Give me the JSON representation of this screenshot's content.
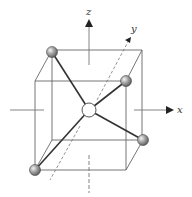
{
  "diagram": {
    "axes": {
      "x_label": "x",
      "y_label": "y",
      "z_label": "z"
    },
    "colors": {
      "line": "#555555",
      "bond": "#333333",
      "atom_fill": "#9a9a9a",
      "center_fill": "#ffffff"
    },
    "atoms": {
      "center": "central atom",
      "ligands": [
        "top-back-left",
        "top-front-right",
        "bottom-back-right",
        "bottom-front-left"
      ]
    }
  }
}
